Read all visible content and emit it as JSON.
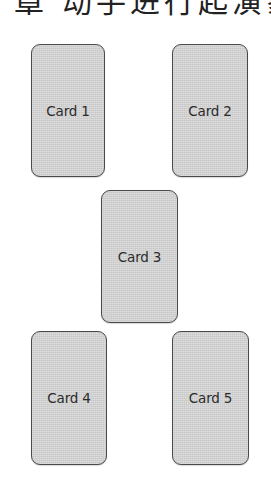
{
  "header": {
    "text": "章 动手进行起演象"
  },
  "cards": [
    {
      "label": "Card 1"
    },
    {
      "label": "Card 2"
    },
    {
      "label": "Card 3"
    },
    {
      "label": "Card 4"
    },
    {
      "label": "Card 5"
    }
  ],
  "colors": {
    "card_fill": "#d6d6d6",
    "card_border": "#4a4a4a",
    "text": "#2b2b2b",
    "background": "#ffffff"
  }
}
